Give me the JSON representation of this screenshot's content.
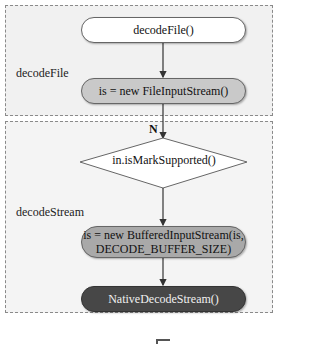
{
  "groups": [
    {
      "label": "decodeFile"
    },
    {
      "label": "decodeStream"
    }
  ],
  "nodes": {
    "start": "decodeFile()",
    "file_input": "is = new FileInputStream()",
    "decision": "in.isMarkSupported()",
    "buffered": "is = new BufferedInputStream(is, DECODE_BUFFER_SIZE)",
    "native": "NativeDecodeStream()"
  },
  "edges": {
    "no_label": "N"
  },
  "colors": {
    "start_fill": "#ffffff",
    "file_input_fill": "#c9c9c9",
    "buffered_fill": "#a9a9a9",
    "native_fill": "#474747",
    "group_border": "#8a8a8a"
  }
}
